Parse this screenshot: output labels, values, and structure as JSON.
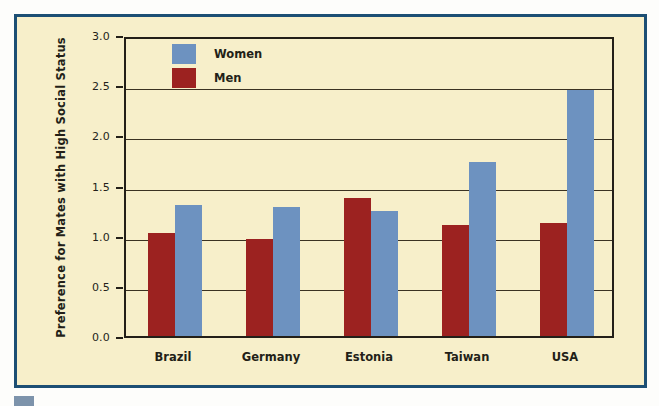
{
  "figure": {
    "panel_border_color": "#1d4f74",
    "panel_background_color": "#f7efca",
    "page_background_color": "#fdfdfb",
    "corner_mark_color": "#7d93ab"
  },
  "chart_data": {
    "type": "bar",
    "title": "",
    "xlabel": "",
    "ylabel": "Preference for Mates with High Social Status",
    "categories": [
      "Brazil",
      "Germany",
      "Estonia",
      "Taiwan",
      "USA"
    ],
    "series": [
      {
        "name": "Women",
        "color": "#6d92c0",
        "values": [
          1.31,
          1.29,
          1.25,
          1.73,
          2.45
        ]
      },
      {
        "name": "Men",
        "color": "#9c2220",
        "values": [
          1.03,
          0.97,
          1.38,
          1.11,
          1.13
        ]
      }
    ],
    "series_order_in_group": [
      "Men",
      "Women"
    ],
    "ylim": [
      0.0,
      3.0
    ],
    "ytick_values": [
      0.0,
      0.5,
      1.0,
      1.5,
      2.0,
      2.5,
      3.0
    ],
    "ytick_labels": [
      "0.0",
      "0.5",
      "1.0",
      "1.5",
      "2.0",
      "2.5",
      "3.0"
    ],
    "grid": true,
    "grid_axis": "y",
    "legend": {
      "position": "upper-left-inside",
      "entries": [
        {
          "label": "Women",
          "color": "#6d92c0"
        },
        {
          "label": "Men",
          "color": "#9c2220"
        }
      ]
    }
  }
}
